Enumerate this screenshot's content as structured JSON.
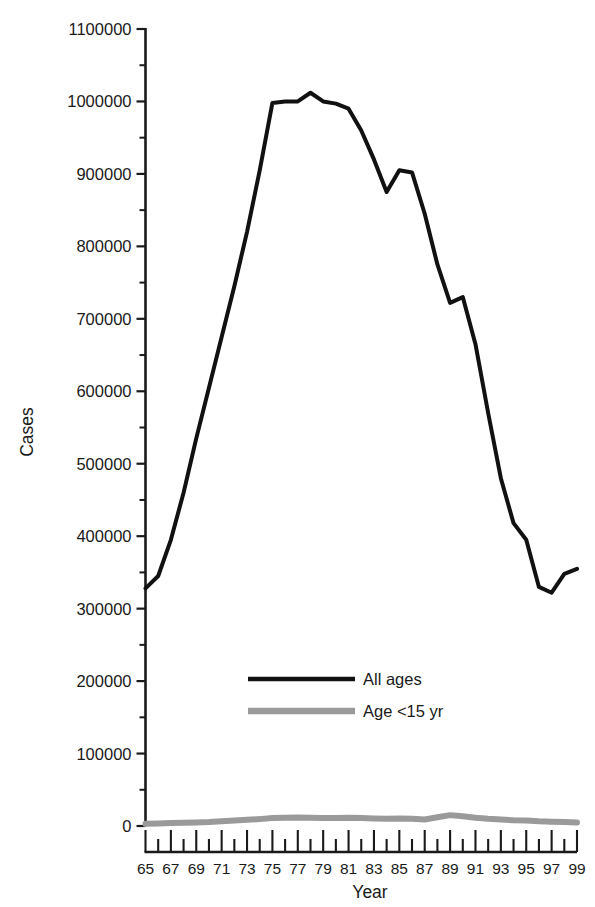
{
  "chart_data": {
    "type": "line",
    "title": "",
    "subtitle": "",
    "xlabel": "Year",
    "ylabel": "Cases",
    "xlim": [
      65,
      99
    ],
    "ylim": [
      0,
      1100000
    ],
    "ytick_step": 100000,
    "yminor_step": 50000,
    "xtick_step": 2,
    "xminor_step": 1,
    "grid": false,
    "legend_position": "inside-center-lower",
    "ytick_labels": [
      "1100000",
      "1000000",
      "900000",
      "800000",
      "700000",
      "600000",
      "500000",
      "400000",
      "300000",
      "200000",
      "100000",
      "0"
    ],
    "ytick_values": [
      1100000,
      1000000,
      900000,
      800000,
      700000,
      600000,
      500000,
      400000,
      300000,
      200000,
      100000,
      0
    ],
    "xtick_labels": [
      "65",
      "67",
      "69",
      "71",
      "73",
      "75",
      "77",
      "79",
      "81",
      "83",
      "85",
      "87",
      "89",
      "91",
      "93",
      "95",
      "97",
      "99"
    ],
    "xtick_values": [
      65,
      67,
      69,
      71,
      73,
      75,
      77,
      79,
      81,
      83,
      85,
      87,
      89,
      91,
      93,
      95,
      97,
      99
    ],
    "x": [
      65,
      66,
      67,
      68,
      69,
      70,
      71,
      72,
      73,
      74,
      75,
      76,
      77,
      78,
      79,
      80,
      81,
      82,
      83,
      84,
      85,
      86,
      87,
      88,
      89,
      90,
      91,
      92,
      93,
      94,
      95,
      96,
      97,
      98,
      99
    ],
    "series": [
      {
        "name": "All ages",
        "color": "#111111",
        "width": 4,
        "values": [
          328000,
          345000,
          395000,
          460000,
          535000,
          605000,
          675000,
          745000,
          820000,
          905000,
          998000,
          1000000,
          1000000,
          1012000,
          1000000,
          997000,
          990000,
          960000,
          920000,
          875000,
          905000,
          902000,
          845000,
          775000,
          722000,
          730000,
          665000,
          570000,
          480000,
          418000,
          395000,
          330000,
          322000,
          348000,
          355000
        ]
      },
      {
        "name": "Age <15 yr",
        "color": "#9a9a9a",
        "width": 6,
        "values": [
          3000,
          3500,
          4000,
          4500,
          5000,
          5500,
          6500,
          7500,
          8500,
          9500,
          11000,
          11500,
          11800,
          11500,
          11000,
          11000,
          11500,
          11000,
          10500,
          10000,
          10500,
          10000,
          9000,
          12000,
          15000,
          13500,
          11500,
          10000,
          9000,
          8000,
          7500,
          6500,
          6000,
          5500,
          5000
        ]
      }
    ],
    "legend": [
      {
        "label": "All ages",
        "color": "#111111",
        "style": "solid-thin"
      },
      {
        "label": "Age <15 yr",
        "color": "#9a9a9a",
        "style": "solid-thick"
      }
    ]
  }
}
